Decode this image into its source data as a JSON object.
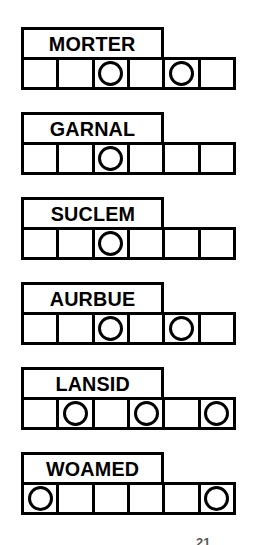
{
  "puzzle": {
    "type": "word-scramble",
    "cells_per_row": 6,
    "colors": {
      "ink": "#000000",
      "paper": "#ffffff"
    },
    "caption_fragment": "21",
    "rows": [
      {
        "word": "MORTER",
        "circled_positions": [
          3,
          5
        ],
        "cells": [
          "",
          "",
          "",
          "",
          "",
          ""
        ]
      },
      {
        "word": "GARNAL",
        "circled_positions": [
          3
        ],
        "cells": [
          "",
          "",
          "",
          "",
          "",
          ""
        ]
      },
      {
        "word": "SUCLEM",
        "circled_positions": [
          3
        ],
        "cells": [
          "",
          "",
          "",
          "",
          "",
          ""
        ]
      },
      {
        "word": "AURBUE",
        "circled_positions": [
          3,
          5
        ],
        "cells": [
          "",
          "",
          "",
          "",
          "",
          ""
        ]
      },
      {
        "word": "LANSID",
        "circled_positions": [
          2,
          4,
          6
        ],
        "cells": [
          "",
          "",
          "",
          "",
          "",
          ""
        ]
      },
      {
        "word": "WOAMED",
        "circled_positions": [
          1,
          6
        ],
        "cells": [
          "",
          "",
          "",
          "",
          "",
          ""
        ]
      }
    ]
  }
}
